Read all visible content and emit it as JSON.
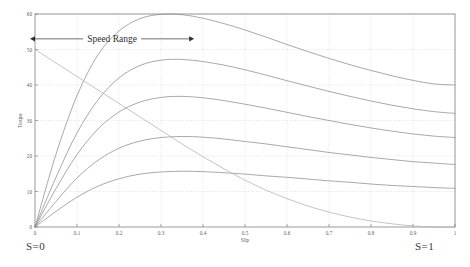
{
  "chart_data": {
    "type": "line",
    "title": "",
    "xlabel": "Slip",
    "ylabel": "Torque",
    "xlim": [
      0,
      1
    ],
    "ylim": [
      0,
      60
    ],
    "grid": true,
    "legend": false,
    "xticks": [
      "0",
      "0.1",
      "0.2",
      "0.3",
      "0.4",
      "0.5",
      "0.6",
      "0.7",
      "0.8",
      "0.9",
      "1"
    ],
    "xtick_values": [
      0,
      0.1,
      0.2,
      0.3,
      0.4,
      0.5,
      0.6,
      0.7,
      0.8,
      0.9,
      1
    ],
    "yticks": [
      "0",
      "10",
      "20",
      "30",
      "40",
      "50",
      "60"
    ],
    "ytick_values": [
      0,
      10,
      20,
      30,
      40,
      50,
      60
    ],
    "x": [
      0,
      0.05,
      0.1,
      0.15,
      0.2,
      0.25,
      0.3,
      0.35,
      0.4,
      0.45,
      0.5,
      0.55,
      0.6,
      0.65,
      0.7,
      0.75,
      0.8,
      0.85,
      0.9,
      0.95,
      1
    ],
    "series": [
      {
        "name": "Torque curve 1 (highest rotor resistance / rated voltage)",
        "color": "#8c8c8c",
        "values": [
          0,
          20.5,
          37.0,
          48.5,
          55.2,
          58.7,
          59.9,
          59.8,
          58.8,
          57.3,
          55.5,
          53.5,
          51.4,
          49.4,
          47.5,
          45.7,
          44.1,
          42.6,
          41.3,
          40.3,
          40.0
        ]
      },
      {
        "name": "Torque curve 2",
        "color": "#8c8c8c",
        "values": [
          0,
          14.0,
          26.5,
          35.8,
          42.0,
          45.5,
          47.0,
          47.2,
          46.6,
          45.6,
          44.3,
          42.8,
          41.2,
          39.7,
          38.2,
          36.8,
          35.5,
          34.3,
          33.3,
          32.5,
          32.0
        ]
      },
      {
        "name": "Torque curve 3",
        "color": "#8c8c8c",
        "values": [
          0,
          10.8,
          20.4,
          27.6,
          32.4,
          35.2,
          36.5,
          36.8,
          36.4,
          35.6,
          34.6,
          33.5,
          32.3,
          31.1,
          30.0,
          28.9,
          27.9,
          27.0,
          26.2,
          25.6,
          25.2
        ]
      },
      {
        "name": "Torque curve 4",
        "color": "#8c8c8c",
        "values": [
          0,
          7.2,
          13.8,
          18.8,
          22.2,
          24.2,
          25.2,
          25.5,
          25.3,
          24.8,
          24.1,
          23.4,
          22.6,
          21.8,
          21.0,
          20.3,
          19.6,
          19.0,
          18.4,
          18.0,
          17.6
        ]
      },
      {
        "name": "Torque curve 5 (lowest voltage)",
        "color": "#8c8c8c",
        "values": [
          0,
          4.4,
          8.4,
          11.5,
          13.6,
          14.9,
          15.5,
          15.7,
          15.6,
          15.3,
          14.9,
          14.4,
          14.0,
          13.5,
          13.0,
          12.6,
          12.1,
          11.7,
          11.4,
          11.1,
          10.9
        ]
      },
      {
        "name": "Load line (load torque vs slip)",
        "color": "#b0b0b0",
        "values": [
          50.0,
          46.2,
          42.4,
          38.6,
          34.8,
          31.0,
          27.2,
          23.4,
          19.8,
          16.4,
          13.2,
          10.4,
          8.0,
          5.9,
          4.2,
          2.8,
          1.7,
          0.9,
          0.3,
          0.0,
          0.0
        ]
      }
    ],
    "annotations": [
      {
        "name": "speed-range",
        "text": "Speed Range",
        "x_start": 0.0,
        "x_end": 0.36,
        "y": 53.0,
        "style": "double-headed-arrow"
      }
    ]
  },
  "labels": {
    "s_zero": "S=0",
    "s_one": "S=1"
  }
}
